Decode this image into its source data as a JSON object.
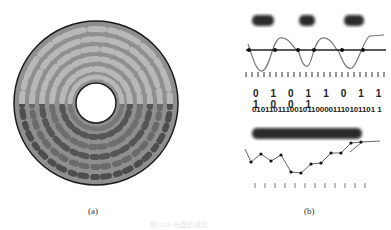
{
  "figure": {
    "panel_a": {
      "label": "(a)",
      "description": "Optical disc surface with concentric tracks of pits",
      "colors": {
        "disc": "#9a9a9a",
        "pit_light": "#b5b5b5",
        "pit_dark": "#555555",
        "hole": "#ffffff",
        "edge": "#222222"
      }
    },
    "panel_b": {
      "label": "(b)",
      "pits_row": [
        "pit",
        "pit",
        "pit"
      ],
      "clock_ticks": 24,
      "bits_large": "0 1 0 1 1 0 1 1 1 0 0 1",
      "bits_small": "01011011100101100001110101101 1",
      "signal_ticks": 12
    },
    "footnote": "图 5.19 光盘的读出"
  }
}
